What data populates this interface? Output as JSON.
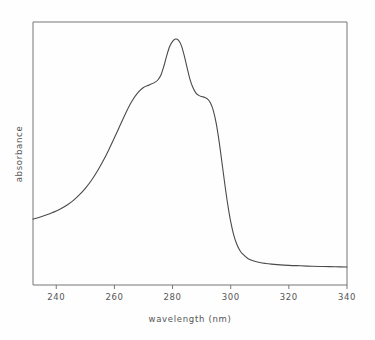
{
  "chart_data": {
    "type": "line",
    "title": "",
    "xlabel": "wavelength (nm)",
    "ylabel": "absorbance",
    "xlim": [
      232,
      340
    ],
    "ylim": [
      0,
      1
    ],
    "grid": false,
    "legend": null,
    "x_ticks": [
      240,
      260,
      280,
      300,
      320,
      340
    ],
    "x_tick_labels": [
      "240",
      "260",
      "280",
      "300",
      "320",
      "340"
    ],
    "y_ticks": [],
    "y_tick_labels": [],
    "annotations": [],
    "series": [
      {
        "name": "absorbance spectrum",
        "color": "#4a4a4a",
        "x": [
          232,
          234,
          236,
          238,
          240,
          242,
          244,
          246,
          248,
          250,
          252,
          254,
          256,
          258,
          260,
          262,
          264,
          266,
          268,
          270,
          272,
          274,
          275,
          276,
          277,
          278,
          279,
          280,
          281,
          282,
          283,
          284,
          285,
          286,
          287,
          288,
          289,
          290,
          291,
          292,
          293,
          294,
          295,
          296,
          297,
          298,
          299,
          300,
          301,
          302,
          303,
          304,
          306,
          308,
          310,
          312,
          314,
          316,
          320,
          324,
          328,
          332,
          336,
          340
        ],
        "y": [
          0.24,
          0.247,
          0.255,
          0.264,
          0.274,
          0.287,
          0.302,
          0.32,
          0.343,
          0.37,
          0.402,
          0.44,
          0.483,
          0.531,
          0.583,
          0.637,
          0.69,
          0.737,
          0.773,
          0.795,
          0.806,
          0.818,
          0.828,
          0.848,
          0.885,
          0.93,
          0.968,
          0.99,
          1.0,
          0.995,
          0.973,
          0.931,
          0.879,
          0.83,
          0.795,
          0.773,
          0.762,
          0.757,
          0.754,
          0.747,
          0.731,
          0.699,
          0.645,
          0.569,
          0.478,
          0.385,
          0.3,
          0.229,
          0.175,
          0.137,
          0.111,
          0.094,
          0.073,
          0.063,
          0.057,
          0.053,
          0.05,
          0.048,
          0.045,
          0.043,
          0.041,
          0.04,
          0.039,
          0.038
        ]
      }
    ]
  },
  "axes": {
    "x_axis_title": "wavelength (nm)",
    "y_axis_title": "absorbance"
  }
}
